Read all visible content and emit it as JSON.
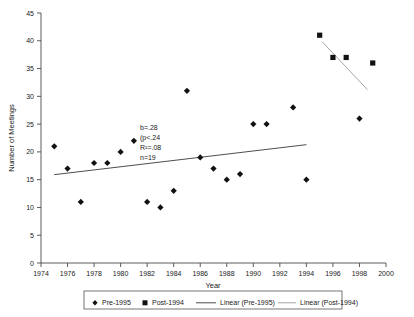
{
  "chart_data": {
    "type": "scatter",
    "title": "",
    "xlabel": "Year",
    "ylabel": "Number of Meetings",
    "xlim": [
      1974,
      2000
    ],
    "ylim": [
      0,
      45
    ],
    "xticks": [
      1974,
      1976,
      1978,
      1980,
      1982,
      1984,
      1986,
      1988,
      1990,
      1992,
      1994,
      1996,
      1998,
      2000
    ],
    "yticks": [
      0,
      5,
      10,
      15,
      20,
      25,
      30,
      35,
      40,
      45
    ],
    "grid": false,
    "legend_position": "bottom",
    "series": [
      {
        "name": "Pre-1995",
        "marker": "diamond",
        "color": "#111111",
        "points": [
          {
            "x": 1975,
            "y": 21
          },
          {
            "x": 1976,
            "y": 17
          },
          {
            "x": 1977,
            "y": 11
          },
          {
            "x": 1978,
            "y": 18
          },
          {
            "x": 1979,
            "y": 18
          },
          {
            "x": 1980,
            "y": 20
          },
          {
            "x": 1981,
            "y": 22
          },
          {
            "x": 1982,
            "y": 11
          },
          {
            "x": 1983,
            "y": 10
          },
          {
            "x": 1984,
            "y": 13
          },
          {
            "x": 1985,
            "y": 31
          },
          {
            "x": 1986,
            "y": 19
          },
          {
            "x": 1987,
            "y": 17
          },
          {
            "x": 1988,
            "y": 15
          },
          {
            "x": 1989,
            "y": 16
          },
          {
            "x": 1990,
            "y": 25
          },
          {
            "x": 1991,
            "y": 25
          },
          {
            "x": 1993,
            "y": 28
          },
          {
            "x": 1994,
            "y": 15
          },
          {
            "x": 1998,
            "y": 26
          }
        ]
      },
      {
        "name": "Post-1994",
        "marker": "square",
        "color": "#111111",
        "points": [
          {
            "x": 1995,
            "y": 41
          },
          {
            "x": 1996,
            "y": 37
          },
          {
            "x": 1997,
            "y": 37
          },
          {
            "x": 1999,
            "y": 36
          }
        ]
      }
    ],
    "trendlines": [
      {
        "name": "Linear (Pre-1995)",
        "color": "#3a3a3a",
        "x_start": 1975,
        "y_start": 15.9,
        "x_end": 1994,
        "y_end": 21.3
      },
      {
        "name": "Linear (Post-1994)",
        "color": "#9a9a9a",
        "x_start": 1995.2,
        "y_start": 39.8,
        "x_end": 1998.6,
        "y_end": 31.2
      }
    ],
    "annotations": [
      {
        "text": "b=.28"
      },
      {
        "text": "(p<.24"
      },
      {
        "text": "R²=.08"
      },
      {
        "text": "n=19"
      }
    ],
    "legend_entries": [
      {
        "label": "Pre-1995",
        "symbol": "diamond"
      },
      {
        "label": "Post-1994",
        "symbol": "square"
      },
      {
        "label": "Linear (Pre-1995)",
        "symbol": "line-dark"
      },
      {
        "label": "Linear (Post-1994)",
        "symbol": "line-light"
      }
    ]
  }
}
